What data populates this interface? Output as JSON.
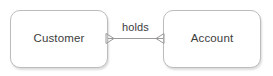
{
  "diagram": {
    "type": "entity-relationship-diagram",
    "canvas": {
      "width": 273,
      "height": 76,
      "background_color": "#ffffff"
    },
    "style": {
      "entity_border_color": "#bcbcbc",
      "entity_fill_color": "#ffffff",
      "text_color": "#3c3c3c",
      "connector_color": "#9a9a9a"
    },
    "entities": [
      {
        "id": "customer",
        "label": "Customer",
        "shape": "rounded-rectangle",
        "x": 10,
        "y": 10,
        "width": 98,
        "height": 58
      },
      {
        "id": "account",
        "label": "Account",
        "shape": "rounded-rectangle",
        "x": 163,
        "y": 10,
        "width": 98,
        "height": 58
      }
    ],
    "relationships": [
      {
        "id": "customer-holds-account",
        "label": "holds",
        "from": "customer",
        "to": "account",
        "from_marker": "crows-foot",
        "to_marker": "crows-foot",
        "line_y": 38,
        "line_x_start": 108,
        "line_x_end": 163
      }
    ]
  }
}
